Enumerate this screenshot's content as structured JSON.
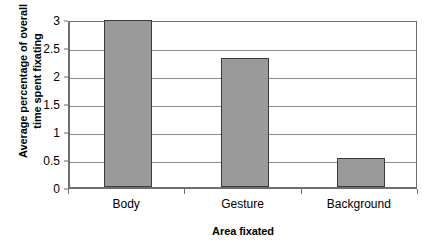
{
  "chart_data": {
    "type": "bar",
    "title": "",
    "categories": [
      "Body",
      "Gesture",
      "Background"
    ],
    "values": [
      2.98,
      2.31,
      0.52
    ],
    "xlabel": "Area fixated",
    "ylabel": "Average percentage of overall time spent fixating",
    "ylabel_lines": [
      "Average percentage of overall",
      "time spent fixating"
    ],
    "ylim": [
      0,
      3
    ],
    "ytick_values": [
      0,
      0.5,
      1,
      1.5,
      2,
      2.5,
      3
    ],
    "ytick_labels": [
      "0",
      "0.5",
      "1",
      "1.5",
      "2",
      "2.5",
      "3"
    ],
    "grid": true,
    "grid_axis": "y",
    "legend": false,
    "legend_position": "none",
    "bar_fill_color": "#9a9a9a",
    "bar_edge_color": "#3a3a3a",
    "gridline_color": "#8a8a8a",
    "axis_color": "#6e6e6e",
    "background_color": "#ffffff"
  }
}
